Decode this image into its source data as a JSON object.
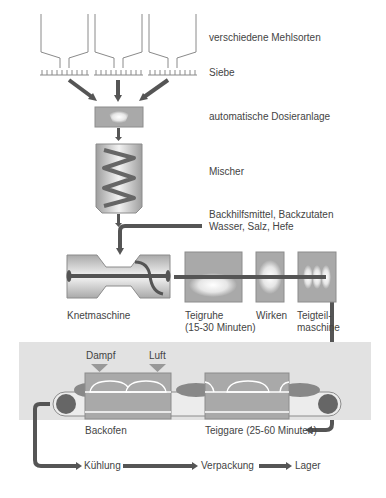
{
  "diagram": {
    "type": "bakery-production-flow",
    "colors": {
      "machine_fill": "#a9a9a9",
      "machine_border": "#8c8c8c",
      "flow_line": "#555555",
      "roller": "#666666",
      "zone_background": "#e2e2e2",
      "text": "#444444"
    },
    "labels": {
      "flour_silos": "verschiedene Mehlsorten",
      "sieves": "Siebe",
      "dosing": "automatische Dosieranlage",
      "mixer": "Mischer",
      "additives_line1": "Backhilfsmittel, Backzutaten",
      "additives_line2": "Wasser, Salz, Hefe",
      "kneader": "Knetmaschine",
      "dough_rest_line1": "Teigruhe",
      "dough_rest_line2": "(15-30 Minuten)",
      "shaping": "Wirken",
      "divider_line1": "Teigteil-",
      "divider_line2": "maschine",
      "steam": "Dampf",
      "air": "Luft",
      "oven": "Backofen",
      "proofing": "Teiggare (25-60 Minuten)",
      "cooling": "Kühlung",
      "packaging": "Verpackung",
      "storage": "Lager"
    },
    "flow_order": [
      "verschiedene Mehlsorten",
      "Siebe",
      "automatische Dosieranlage",
      "Mischer",
      "Knetmaschine",
      "Teigruhe (15-30 Minuten)",
      "Wirken",
      "Teigteilmaschine",
      "Teiggare (25-60 Minuten)",
      "Backofen",
      "Kühlung",
      "Verpackung",
      "Lager"
    ]
  }
}
